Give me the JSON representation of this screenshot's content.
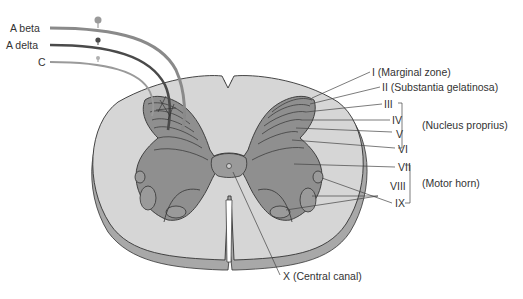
{
  "diagram": {
    "fibers": [
      {
        "label": "A beta",
        "color": "#8a8a8a"
      },
      {
        "label": "A delta",
        "color": "#4a4a4a"
      },
      {
        "label": "C",
        "color": "#9a9a9a"
      }
    ],
    "laminae": [
      {
        "numeral": "I",
        "desc": "(Marginal zone)",
        "label": "I (Marginal zone)"
      },
      {
        "numeral": "II",
        "desc": "(Substantia gelatinosa)",
        "label": "II (Substantia gelatinosa)"
      },
      {
        "numeral": "III",
        "label": "III"
      },
      {
        "numeral": "IV",
        "label": "IV"
      },
      {
        "numeral": "V",
        "label": "V"
      },
      {
        "numeral": "VI",
        "label": "VI"
      },
      {
        "numeral": "VII",
        "label": "VII"
      },
      {
        "numeral": "VIII",
        "label": "VIII"
      },
      {
        "numeral": "IX",
        "label": "IX"
      },
      {
        "numeral": "X",
        "desc": "(Central canal)",
        "label": "X (Central canal)"
      }
    ],
    "groups": {
      "nucleus_proprius": "(Nucleus proprius)",
      "motor_horn": "(Motor horn)"
    },
    "colors": {
      "white_matter": "#d6d6d6",
      "white_matter_edge": "#a8a8a8",
      "gray_matter": "#8f8f8f",
      "outline": "#333333",
      "background": "#ffffff"
    }
  }
}
